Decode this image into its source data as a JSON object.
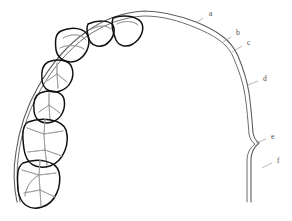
{
  "figure": {
    "kind": "line-drawing",
    "title": "",
    "background_color": "#ffffff",
    "tooth_outline_color": "#111111",
    "tooth_detail_color": "#9a9a9a",
    "wire_color": "#5c5c5c",
    "leader_color": "#9a9a9a",
    "label_color": "#4a4a4a",
    "width": 292,
    "height": 221
  },
  "labels": [
    {
      "id": "a",
      "text": "a",
      "x": 209,
      "y": 14,
      "leader_x1": 203,
      "leader_y1": 18,
      "leader_x2": 196,
      "leader_y2": 23
    },
    {
      "id": "b",
      "text": "b",
      "x": 236,
      "y": 33,
      "leader_x1": 231,
      "leader_y1": 37,
      "leader_x2": 223,
      "leader_y2": 42
    },
    {
      "id": "c",
      "text": "c",
      "x": 247,
      "y": 43,
      "leader_x1": 242,
      "leader_y1": 46,
      "leader_x2": 232,
      "leader_y2": 52
    },
    {
      "id": "d",
      "text": "d",
      "x": 263,
      "y": 79,
      "leader_x1": 258,
      "leader_y1": 81,
      "leader_x2": 248,
      "leader_y2": 85
    },
    {
      "id": "e",
      "text": "e",
      "x": 271,
      "y": 137,
      "leader_x1": 266,
      "leader_y1": 139,
      "leader_x2": 256,
      "leader_y2": 143
    },
    {
      "id": "f",
      "text": "f",
      "x": 277,
      "y": 161,
      "leader_x1": 272,
      "leader_y1": 163,
      "leader_x2": 262,
      "leader_y2": 168
    }
  ],
  "teeth": [
    {
      "name": "central-incisor",
      "outline": "M 113 18 C 123 14 136 16 141 22 C 145 28 142 38 133 44 C 126 48 119 46 116 40 C 113 33 111 24 113 18 Z",
      "details": [
        "M 117 24 C 124 20 134 21 138 25"
      ]
    },
    {
      "name": "lateral-incisor",
      "outline": "M 88 24 C 97 20 109 20 113 25 C 116 31 113 40 105 45 C 98 48 91 45 89 39 C 87 33 86 28 88 24 Z",
      "details": [
        "M 92 29 C 99 25 107 25 111 29"
      ]
    },
    {
      "name": "canine",
      "outline": "M 61 31 C 72 26 85 28 88 36 C 91 45 86 57 76 61 C 66 64 58 59 56 50 C 55 41 55 34 61 31 Z",
      "details": [
        "M 63 38 C 72 33 82 34 86 40",
        "M 60 48 C 68 44 78 45 84 49"
      ]
    },
    {
      "name": "first-premolar",
      "outline": "M 48 62 C 58 58 70 60 72 68 C 75 77 70 88 60 91 C 50 94 43 89 42 80 C 41 71 42 65 48 62 Z",
      "details": [
        "M 57 63 L 57 74",
        "M 57 74 L 47 81",
        "M 57 74 L 67 82",
        "M 57 74 L 58 88"
      ]
    },
    {
      "name": "second-premolar",
      "outline": "M 40 93 C 50 89 62 91 64 99 C 66 108 62 119 52 122 C 42 125 35 120 34 111 C 33 102 34 96 40 93 Z",
      "details": [
        "M 49 93 L 49 105",
        "M 49 105 L 39 112",
        "M 49 105 L 60 113",
        "M 49 105 L 50 120"
      ]
    },
    {
      "name": "first-molar",
      "outline": "M 28 122 C 42 117 62 119 66 130 C 70 143 64 161 50 166 C 36 170 26 164 24 149 C 22 135 22 126 28 122 Z",
      "details": [
        "M 45 119 L 44 134",
        "M 44 134 L 27 128",
        "M 44 134 L 63 131",
        "M 44 134 L 45 150",
        "M 45 150 L 28 152",
        "M 45 150 L 62 156",
        "M 45 150 L 47 165"
      ]
    },
    {
      "name": "second-molar",
      "outline": "M 23 163 C 37 158 56 160 59 172 C 62 185 56 203 42 207 C 29 211 20 204 18 190 C 17 176 17 167 23 163 Z",
      "details": [
        "M 40 160 L 39 175",
        "M 39 175 L 22 170",
        "M 39 175 L 56 173",
        "M 39 175 L 40 190",
        "M 39 175 C 30 180 26 188 25 196",
        "M 40 190 L 24 193",
        "M 40 190 L 55 197",
        "M 40 190 L 41 206"
      ]
    }
  ],
  "wire": {
    "name": "archwire",
    "outer_path": "M 17 202 C 14 188 13 170 16 152 C 19 131 26 108 38 87 C 50 66 66 46 86 32 C 104 19 124 12 144 11 C 164 11 180 16 196 22 C 206 26 214 30 222 36 C 229 41 234 47 238 56 C 243 68 247 80 249 93 C 251 106 252 120 253 133 C 254 138 256 141 259 143 C 254 147 251 152 251 160 C 251 175 251 190 251 202",
    "inner_path": "M 20 202 C 17 188 16 170 19 152 C 22 131 29 109 41 89 C 52 69 68 50 87 36 C 105 24 124 17 144 16 C 163 16 179 21 194 27 C 204 31 212 35 219 40 C 226 45 231 51 234 59 C 239 71 243 82 245 95 C 247 108 248 121 249 134 C 250 139 252 142 255 144 C 250 148 247 153 247 161 C 247 176 247 190 247 202"
  }
}
